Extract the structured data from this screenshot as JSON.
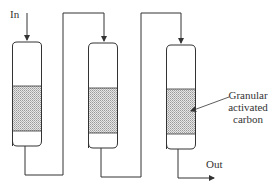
{
  "diagram": {
    "labels": {
      "inlet": "In",
      "outlet": "Out",
      "media_line1": "Granular",
      "media_line2": "activated",
      "media_line3": "carbon"
    },
    "columns": [
      {
        "id": 1,
        "x": 12,
        "width": 30,
        "top": 42,
        "bottom": 145,
        "media_top": 86,
        "media_bottom": 131
      },
      {
        "id": 2,
        "x": 88,
        "width": 30,
        "top": 43,
        "bottom": 147,
        "media_top": 88,
        "media_bottom": 133
      },
      {
        "id": 3,
        "x": 166,
        "width": 30,
        "top": 45,
        "bottom": 148,
        "media_top": 89,
        "media_bottom": 134
      }
    ],
    "colors": {
      "line": "#333333",
      "media_fill": "#c8c8c8"
    },
    "flow": "In -> Column 1 -> Column 2 -> Column 3 -> Out"
  }
}
